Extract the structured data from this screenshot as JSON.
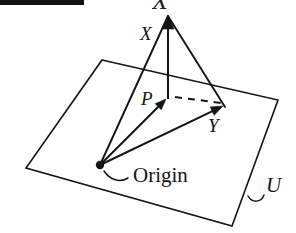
{
  "figure": {
    "kind": "geometry-diagram",
    "width": 296,
    "height": 233,
    "background_color": "#ffffff",
    "ink_color": "#141414"
  },
  "redaction": {
    "present": true,
    "color": "#121212",
    "x": 0,
    "y": 0,
    "width": 84,
    "height": 5
  },
  "clipped_top_glyph": {
    "text": "X",
    "x": 152,
    "y": -12,
    "font_size": 26
  },
  "labels": [
    {
      "id": "label-x",
      "text": "X",
      "style": "italic",
      "x": 140,
      "y": 40,
      "font_size": 19
    },
    {
      "id": "label-p",
      "text": "P",
      "style": "italic",
      "x": 141,
      "y": 105,
      "font_size": 19
    },
    {
      "id": "label-y",
      "text": "Y",
      "style": "italic",
      "x": 208,
      "y": 132,
      "font_size": 19
    },
    {
      "id": "label-origin",
      "text": "Origin",
      "style": "roman",
      "x": 133,
      "y": 182,
      "font_size": 21
    },
    {
      "id": "label-u",
      "text": "U",
      "style": "italic",
      "x": 266,
      "y": 192,
      "font_size": 21
    }
  ],
  "geometry": {
    "plane": {
      "name": "U",
      "corners": [
        [
          102,
          60
        ],
        [
          278,
          100
        ],
        [
          232,
          226
        ],
        [
          26,
          168
        ]
      ]
    },
    "points": {
      "apex_x": [
        168,
        15
      ],
      "origin": [
        100,
        165
      ],
      "p": [
        166,
        99
      ],
      "y": [
        223,
        106
      ]
    },
    "vectors": [
      {
        "id": "vector-origin-to-p",
        "from": [
          100,
          165
        ],
        "to": [
          166,
          99
        ],
        "arrow": true,
        "dashed": false
      },
      {
        "id": "vector-origin-to-y",
        "from": [
          100,
          165
        ],
        "to": [
          223,
          106
        ],
        "arrow": true,
        "dashed": false
      },
      {
        "id": "vector-p-to-apex",
        "from": [
          168,
          99
        ],
        "to": [
          168,
          15
        ],
        "arrow": true,
        "dashed": false
      },
      {
        "id": "segment-origin-to-apex",
        "from": [
          100,
          165
        ],
        "to": [
          168,
          16
        ],
        "arrow": false,
        "dashed": false
      },
      {
        "id": "segment-apex-to-y",
        "from": [
          168,
          16
        ],
        "to": [
          225,
          107
        ],
        "arrow": false,
        "dashed": false
      },
      {
        "id": "dashed-p-to-y",
        "from": [
          175,
          97
        ],
        "to": [
          221,
          103
        ],
        "arrow": false,
        "dashed": true
      }
    ],
    "origin_dot": {
      "cx": 100,
      "cy": 165,
      "r": 4.2
    },
    "leaders": [
      {
        "id": "leader-origin",
        "path": "M 128 178 C 120 183 110 180 104 171"
      },
      {
        "id": "leader-u",
        "path": "M 248 196 C 252 203 261 203 264 195"
      }
    ]
  }
}
